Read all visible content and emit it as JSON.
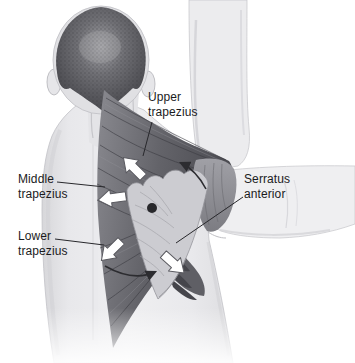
{
  "figure": {
    "type": "anatomical-diagram",
    "style": "grayscale medical illustration on white background"
  },
  "labels": {
    "upper_trapezius": {
      "line1": "Upper",
      "line2": "trapezius"
    },
    "middle_trapezius": {
      "line1": "Middle",
      "line2": "trapezius"
    },
    "lower_trapezius": {
      "line1": "Lower",
      "line2": "trapezius"
    },
    "serratus_anterior": {
      "line1": "Serratus",
      "line2": "anterior"
    }
  },
  "markers": {
    "axis_dot": "black dot on scapula (axis of rotation)",
    "arrows": [
      {
        "name": "upper-trapezius-pull-arrow",
        "style": "white block arrow",
        "direction": "up-left"
      },
      {
        "name": "middle-trapezius-pull-arrow",
        "style": "white block arrow",
        "direction": "left"
      },
      {
        "name": "lower-trapezius-pull-arrow",
        "style": "white block arrow",
        "direction": "down-left"
      },
      {
        "name": "serratus-anterior-pull-arrow",
        "style": "white block arrow",
        "direction": "down-right"
      },
      {
        "name": "rotation-arrow-top",
        "style": "thin curved arrow",
        "direction": "curving up over shoulder"
      },
      {
        "name": "rotation-arrow-bottom",
        "style": "thin curved arrow",
        "direction": "curving right below scapula"
      }
    ]
  },
  "colors": {
    "background": "#ffffff",
    "skin": "#ececee",
    "skin_shadow": "#c6c6ca",
    "hair_dark": "#47474c",
    "muscle_dark": "#4e4e54",
    "muscle_mid": "#8a8a90",
    "scapula_light": "#ccccd1",
    "serratus_dark": "#55555c",
    "label_text": "#1b1b1d",
    "arrow_fill": "#ffffff",
    "arrow_outline": "#5a5a60",
    "leader_line": "#28282c"
  }
}
